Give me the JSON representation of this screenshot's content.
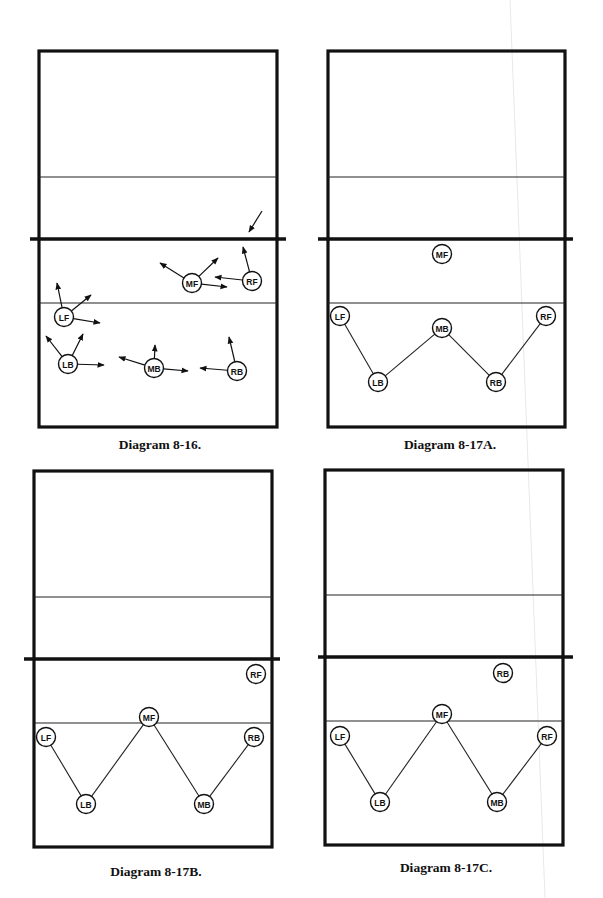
{
  "diagrams": [
    {
      "id": "8-16",
      "caption": "Diagram 8-16.",
      "players": [
        {
          "label": "MF",
          "movements": [
            "back-left",
            "forward-right",
            "right"
          ]
        },
        {
          "label": "RF",
          "movements": [
            "forward",
            "left"
          ]
        },
        {
          "label": "LF",
          "movements": [
            "forward",
            "forward-right",
            "right"
          ]
        },
        {
          "label": "LB",
          "movements": [
            "forward-left",
            "forward-right",
            "right"
          ]
        },
        {
          "label": "MB",
          "movements": [
            "left",
            "forward",
            "right"
          ]
        },
        {
          "label": "RB",
          "movements": [
            "left",
            "forward"
          ]
        }
      ],
      "incoming_ball_arrow": true,
      "rotation_chain": []
    },
    {
      "id": "8-17A",
      "caption": "Diagram 8-17A.",
      "players": [
        {
          "label": "MF"
        },
        {
          "label": "LF"
        },
        {
          "label": "MB"
        },
        {
          "label": "RF"
        },
        {
          "label": "LB"
        },
        {
          "label": "RB"
        }
      ],
      "rotation_chain": [
        "LF",
        "LB",
        "MB",
        "RB",
        "RF"
      ]
    },
    {
      "id": "8-17B",
      "caption": "Diagram 8-17B.",
      "players": [
        {
          "label": "RF"
        },
        {
          "label": "MF"
        },
        {
          "label": "LF"
        },
        {
          "label": "RB"
        },
        {
          "label": "LB"
        },
        {
          "label": "MB"
        }
      ],
      "rotation_chain": [
        "LF",
        "LB",
        "MF",
        "MB",
        "RB"
      ]
    },
    {
      "id": "8-17C",
      "caption": "Diagram 8-17C.",
      "players": [
        {
          "label": "RB"
        },
        {
          "label": "MF"
        },
        {
          "label": "LF"
        },
        {
          "label": "RF"
        },
        {
          "label": "LB"
        },
        {
          "label": "MB"
        }
      ],
      "rotation_chain": [
        "LF",
        "LB",
        "MF",
        "MB",
        "RF"
      ]
    }
  ]
}
